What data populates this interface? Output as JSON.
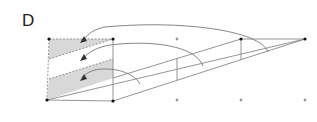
{
  "panel": {
    "label": "D"
  },
  "colors": {
    "line": "#888888",
    "dark_point": "#111111",
    "gray_point": "#999999",
    "shade": "#d8d8d8",
    "arrow": "#444444",
    "dashed": "#888888"
  },
  "diagram": {
    "points_dark": [
      [
        49,
        39
      ],
      [
        113,
        39
      ],
      [
        47,
        100
      ],
      [
        113,
        101
      ],
      [
        241,
        39
      ],
      [
        305,
        39
      ]
    ],
    "points_gray": [
      [
        177,
        39
      ],
      [
        177,
        100
      ],
      [
        241,
        100
      ],
      [
        305,
        100
      ]
    ],
    "arrows": 3
  }
}
